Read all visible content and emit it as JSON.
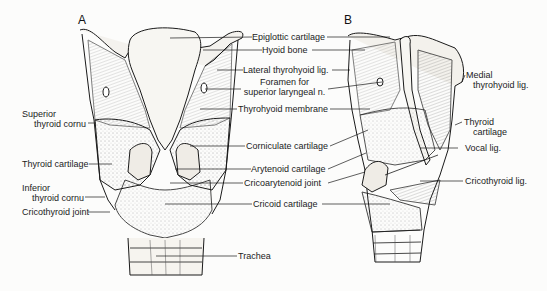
{
  "figure": {
    "panels": [
      {
        "id": "A",
        "label": "A",
        "view": "posterior"
      },
      {
        "id": "B",
        "label": "B",
        "view": "lateral"
      }
    ],
    "left_labels": [
      {
        "key": "superior_thyroid_cornu",
        "line1": "Superior",
        "line2": "thyroid cornu"
      },
      {
        "key": "thyroid_cartilage_left",
        "line1": "Thyroid cartilage"
      },
      {
        "key": "inferior_thyroid_cornu",
        "line1": "Inferior",
        "line2": "thyroid cornu"
      },
      {
        "key": "cricothyroid_joint",
        "line1": "Cricothyroid joint"
      }
    ],
    "center_labels": [
      {
        "key": "epiglottic_cartilage",
        "line1": "Epiglottic cartilage"
      },
      {
        "key": "hyoid_bone",
        "line1": "Hyoid bone"
      },
      {
        "key": "lateral_thyrohyoid_lig",
        "line1": "Lateral thyrohyoid lig."
      },
      {
        "key": "foramen_superior_laryngeal",
        "line1": "Foramen for",
        "line2": "superior laryngeal n."
      },
      {
        "key": "thyrohyoid_membrane",
        "line1": "Thyrohyoid membrane"
      },
      {
        "key": "corniculate_cartilage",
        "line1": "Corniculate cartilage"
      },
      {
        "key": "arytenoid_cartilage",
        "line1": "Arytenoid cartilage"
      },
      {
        "key": "cricoarytenoid_joint",
        "line1": "Cricoarytenoid joint"
      },
      {
        "key": "cricoid_cartilage",
        "line1": "Cricoid cartilage"
      },
      {
        "key": "trachea",
        "line1": "Trachea"
      }
    ],
    "right_labels": [
      {
        "key": "medial_thyrohyoid_lig",
        "line1": "Medial",
        "line2": "thyrohyoid lig."
      },
      {
        "key": "thyroid_cartilage_right",
        "line1": "Thyroid",
        "line2": "cartilage"
      },
      {
        "key": "vocal_lig",
        "line1": "Vocal lig."
      },
      {
        "key": "cricothyroid_lig",
        "line1": "Cricothyroid lig."
      }
    ]
  }
}
